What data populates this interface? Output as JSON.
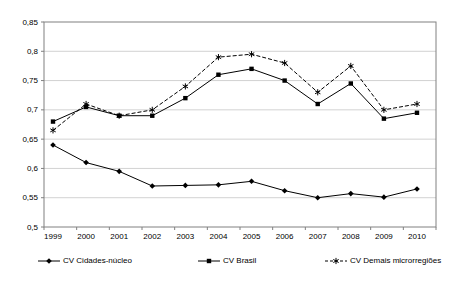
{
  "chart_data": {
    "type": "line",
    "title": "",
    "xlabel": "",
    "ylabel": "",
    "grid": true,
    "legend_position": "bottom",
    "ylim": [
      0.5,
      0.85
    ],
    "ytick_step": 0.05,
    "categories": [
      "1999",
      "2000",
      "2001",
      "2002",
      "2003",
      "2004",
      "2005",
      "2006",
      "2007",
      "2008",
      "2009",
      "2010"
    ],
    "yticks": [
      {
        "v": 0.5,
        "label": "0,5"
      },
      {
        "v": 0.55,
        "label": "0,55"
      },
      {
        "v": 0.6,
        "label": "0,6"
      },
      {
        "v": 0.65,
        "label": "0,65"
      },
      {
        "v": 0.7,
        "label": "0,7"
      },
      {
        "v": 0.75,
        "label": "0,75"
      },
      {
        "v": 0.8,
        "label": "0,8"
      },
      {
        "v": 0.85,
        "label": "0,85"
      }
    ],
    "series": [
      {
        "name": "CV Cidades-núcleo",
        "line": "solid",
        "marker": "diamond",
        "values": [
          0.64,
          0.61,
          0.595,
          0.57,
          0.571,
          0.572,
          0.578,
          0.562,
          0.55,
          0.557,
          0.551,
          0.565
        ]
      },
      {
        "name": "CV Brasil",
        "line": "solid",
        "marker": "square",
        "values": [
          0.68,
          0.705,
          0.69,
          0.69,
          0.72,
          0.76,
          0.77,
          0.75,
          0.71,
          0.745,
          0.685,
          0.695
        ]
      },
      {
        "name": "CV Demais microrregiões",
        "line": "dashed",
        "marker": "star",
        "values": [
          0.665,
          0.71,
          0.69,
          0.7,
          0.74,
          0.79,
          0.795,
          0.78,
          0.73,
          0.775,
          0.7,
          0.71
        ]
      }
    ],
    "colors": {
      "series_stroke": "#000000",
      "grid": "#d2d2d2",
      "axis_border": "#808080",
      "background": "#ffffff",
      "text": "#000000"
    }
  }
}
